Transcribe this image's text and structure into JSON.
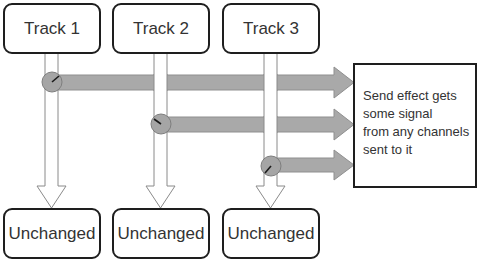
{
  "diagram": {
    "tracks": [
      {
        "label": "Track 1",
        "output_label": "Unchanged"
      },
      {
        "label": "Track 2",
        "output_label": "Unchanged"
      },
      {
        "label": "Track 3",
        "output_label": "Unchanged"
      }
    ],
    "send_box": {
      "lines": [
        "Send effect gets",
        "some signal",
        "from any channels",
        "sent to it"
      ]
    },
    "colors": {
      "box_border": "#1e1e1e",
      "send_arrow_fill": "#a9a9a9",
      "knob_fill": "#a5a5a5",
      "signal_arrow_fill": "#ffffff",
      "signal_arrow_stroke": "#8a8a8a"
    }
  }
}
